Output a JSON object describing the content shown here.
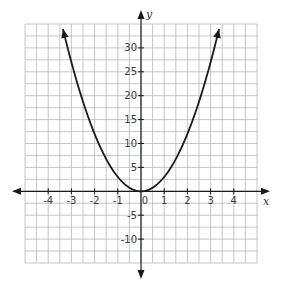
{
  "chart_data": {
    "type": "line",
    "title": "",
    "xlabel": "x",
    "ylabel": "y",
    "xlim": [
      -5,
      5
    ],
    "ylim": [
      -15,
      35
    ],
    "grid": true,
    "x_ticks": [
      -4,
      -3,
      -2,
      -1,
      0,
      1,
      2,
      3,
      4
    ],
    "x_tick_labels": [
      "-4",
      "-3",
      "-2",
      "-1",
      "0",
      "1",
      "2",
      "3",
      "4"
    ],
    "y_ticks": [
      -10,
      -5,
      5,
      10,
      15,
      20,
      25,
      30
    ],
    "y_tick_labels": [
      "-10",
      "-5",
      "5",
      "10",
      "15",
      "20",
      "25",
      "30"
    ],
    "series": [
      {
        "name": "parabola",
        "equation": "y = 3x^2",
        "x": [
          -3.4,
          -3,
          -2.5,
          -2,
          -1.5,
          -1,
          -0.5,
          0,
          0.5,
          1,
          1.5,
          2,
          2.5,
          3,
          3.4
        ],
        "values": [
          34.7,
          27,
          18.75,
          12,
          6.75,
          3,
          0.75,
          0,
          0.75,
          3,
          6.75,
          12,
          18.75,
          27,
          34.7
        ],
        "color": "#1a1a1a",
        "arrows": "both ends"
      }
    ]
  },
  "colors": {
    "grid": "#b8b8b8",
    "axis": "#1a1a1a",
    "curve": "#1a1a1a"
  },
  "labels": {
    "x_axis": "x",
    "y_axis": "y"
  }
}
